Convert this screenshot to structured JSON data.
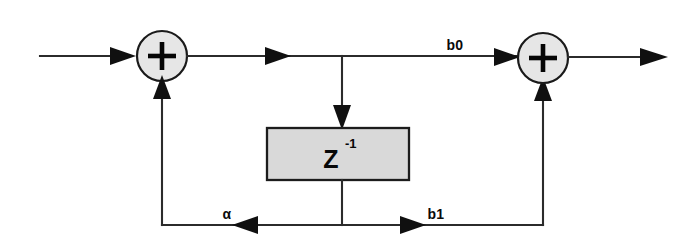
{
  "figure": {
    "kind": "signal-flow-diagram",
    "background_color": "#ffffff",
    "line_color": "#2b2b2b",
    "block_fill_color": "#d9d9d9",
    "adder_fill_color": "#e6e6e6"
  },
  "blocks": {
    "delay": {
      "symbol": "Z",
      "exponent": "-1",
      "full_label": "Z-1",
      "x": 267,
      "y": 128,
      "width": 142,
      "height": 52
    },
    "adder_left": {
      "symbol": "+",
      "name": "summing-junction-input",
      "cx": 162,
      "cy": 56,
      "r": 25
    },
    "adder_right": {
      "symbol": "+",
      "name": "summing-junction-output",
      "cx": 543,
      "cy": 58,
      "r": 25
    }
  },
  "labels": {
    "b0": "b0",
    "b1": "b1",
    "alpha": "α"
  },
  "signals": [
    {
      "name": "input-line",
      "from": "input",
      "to": "adder-left"
    },
    {
      "name": "adder-left-output",
      "from": "adder-left",
      "to": "branch-node"
    },
    {
      "name": "forward-b0-path",
      "from": "branch-node",
      "to": "adder-right",
      "gain": "b0"
    },
    {
      "name": "delay-input",
      "from": "branch-node",
      "to": "delay"
    },
    {
      "name": "delay-output",
      "from": "delay",
      "to": "feedback-bus"
    },
    {
      "name": "feedback-alpha-path",
      "from": "feedback-bus",
      "to": "adder-left",
      "gain": "α"
    },
    {
      "name": "feedforward-b1-path",
      "from": "feedback-bus",
      "to": "adder-right",
      "gain": "b1"
    },
    {
      "name": "output-line",
      "from": "adder-right",
      "to": "output"
    }
  ]
}
